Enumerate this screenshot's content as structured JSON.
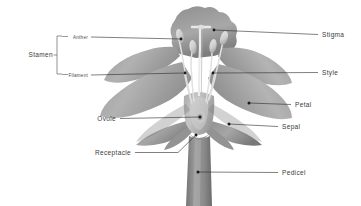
{
  "diagram": {
    "background_color": "#ffffff",
    "line_color": "#2b2b2b",
    "text_color": "#3a3a3a",
    "palette": {
      "petal_light": "#b9b9b9",
      "petal_mid": "#a3a3a3",
      "petal_dark": "#8a8a8a",
      "petal_shadow": "#6f6f6f",
      "sepal": "#9b9b9b",
      "stem": "#8d8d8d",
      "stem_dark": "#6e6e6e",
      "anther": "#d2d2d2",
      "filament": "#e4e4e4",
      "ovary": "#bdbdbd",
      "highlight": "#efefef"
    }
  },
  "labels": {
    "stamen": {
      "text": "Stamen",
      "size": "large",
      "anchor": "end",
      "x": 53,
      "y": 57,
      "bracket": true
    },
    "anther": {
      "text": "Anther",
      "size": "small",
      "anchor": "end",
      "x": 88,
      "y": 37,
      "target_x": 181,
      "target_y": 39
    },
    "filament": {
      "text": "Filament",
      "size": "small",
      "anchor": "end",
      "x": 88,
      "y": 75,
      "target_x": 185,
      "target_y": 73
    },
    "ovule": {
      "text": "Ovule",
      "size": "large",
      "anchor": "end",
      "x": 116,
      "y": 119,
      "target_x": 200,
      "target_y": 117
    },
    "receptacle": {
      "text": "Receptacle",
      "size": "large",
      "anchor": "end",
      "x": 131,
      "y": 153,
      "target_x": 196,
      "target_y": 135
    },
    "stigma": {
      "text": "Stigma",
      "size": "large",
      "anchor": "start",
      "x": 322,
      "y": 35,
      "target_x": 214,
      "target_y": 30
    },
    "style": {
      "text": "Style",
      "size": "large",
      "anchor": "start",
      "x": 322,
      "y": 73,
      "target_x": 213,
      "target_y": 73
    },
    "petal": {
      "text": "Petal",
      "size": "large",
      "anchor": "start",
      "x": 295,
      "y": 105,
      "target_x": 249,
      "target_y": 103
    },
    "sepal": {
      "text": "Sepal",
      "size": "large",
      "anchor": "start",
      "x": 282,
      "y": 127,
      "target_x": 229,
      "target_y": 124
    },
    "pedicel": {
      "text": "Pedicel",
      "size": "large",
      "anchor": "start",
      "x": 282,
      "y": 173,
      "target_x": 196,
      "target_y": 172
    }
  },
  "parts": [
    "petal",
    "sepal",
    "stamen",
    "anther",
    "filament",
    "pistil",
    "stigma",
    "style",
    "ovary",
    "ovule",
    "receptacle",
    "pedicel"
  ]
}
